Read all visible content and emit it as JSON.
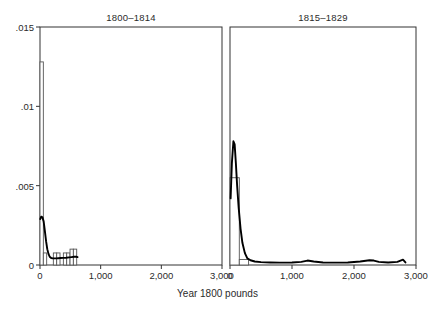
{
  "chart_data": {
    "type": "histogram",
    "title": "",
    "xlabel": "Year 1800 pounds",
    "ylabel": "",
    "xlim": [
      0,
      3000
    ],
    "ylim": [
      0,
      0.015
    ],
    "grid": false,
    "legend": "none",
    "xticks": [
      0,
      1000,
      2000,
      3000
    ],
    "xtick_labels": [
      "0",
      "1,000",
      "2,000",
      "3,000"
    ],
    "yticks": [
      0,
      0.005,
      0.01,
      0.015
    ],
    "ytick_labels": [
      "0",
      ".005",
      ".01",
      ".015"
    ],
    "panels": [
      {
        "title": "1800–1814",
        "histogram": {
          "bin_width": 55,
          "bins": [
            {
              "x0": 0,
              "x1": 55,
              "density": 0.0128
            },
            {
              "x0": 55,
              "x1": 110,
              "density": 0.00076
            },
            {
              "x0": 110,
              "x1": 165,
              "density": 0.0
            },
            {
              "x0": 165,
              "x1": 220,
              "density": 0.0
            },
            {
              "x0": 220,
              "x1": 275,
              "density": 0.00076
            },
            {
              "x0": 275,
              "x1": 330,
              "density": 0.00076
            },
            {
              "x0": 330,
              "x1": 385,
              "density": 0.0
            },
            {
              "x0": 385,
              "x1": 440,
              "density": 0.00076
            },
            {
              "x0": 440,
              "x1": 495,
              "density": 0.00076
            },
            {
              "x0": 495,
              "x1": 550,
              "density": 0.001
            },
            {
              "x0": 550,
              "x1": 605,
              "density": 0.001
            }
          ]
        },
        "kernel_density": {
          "x": [
            5,
            20,
            40,
            60,
            80,
            100,
            120,
            140,
            160,
            185,
            210,
            240,
            270,
            300,
            340,
            380,
            430,
            480,
            520,
            560,
            600,
            620
          ],
          "y": [
            0.0029,
            0.00305,
            0.003,
            0.00275,
            0.00215,
            0.0015,
            0.001,
            0.0007,
            0.00052,
            0.00044,
            0.00042,
            0.00042,
            0.00042,
            0.00043,
            0.00044,
            0.00045,
            0.00046,
            0.00048,
            0.0005,
            0.00052,
            0.00052,
            0.0005
          ]
        }
      },
      {
        "title": "1815–1829",
        "histogram": {
          "bin_width": 150,
          "bins": [
            {
              "x0": 0,
              "x1": 150,
              "density": 0.0055
            },
            {
              "x0": 150,
              "x1": 300,
              "density": 0.00035
            },
            {
              "x0": 300,
              "x1": 450,
              "density": 0.0
            }
          ]
        },
        "kernel_density": {
          "x": [
            10,
            30,
            55,
            75,
            95,
            115,
            140,
            170,
            200,
            240,
            280,
            330,
            400,
            500,
            650,
            800,
            1000,
            1150,
            1250,
            1350,
            1500,
            1700,
            1900,
            2100,
            2250,
            2320,
            2400,
            2550,
            2700,
            2790,
            2830
          ],
          "y": [
            0.0042,
            0.0064,
            0.0078,
            0.0076,
            0.0064,
            0.005,
            0.0036,
            0.0023,
            0.0014,
            0.00075,
            0.00042,
            0.0003,
            0.00022,
            0.00018,
            0.00016,
            0.00015,
            0.00016,
            0.0002,
            0.00028,
            0.00022,
            0.00016,
            0.00015,
            0.00016,
            0.00022,
            0.0003,
            0.00028,
            0.0002,
            0.00016,
            0.0002,
            0.00034,
            0.00016
          ]
        }
      }
    ]
  },
  "axis": {
    "x_title": "Year 1800 pounds"
  },
  "style": {
    "axis_color": "#333333",
    "bar_fill": "#ffffff",
    "bar_stroke": "#555555",
    "density_color": "#000000",
    "text_color": "#2b2b2b"
  }
}
